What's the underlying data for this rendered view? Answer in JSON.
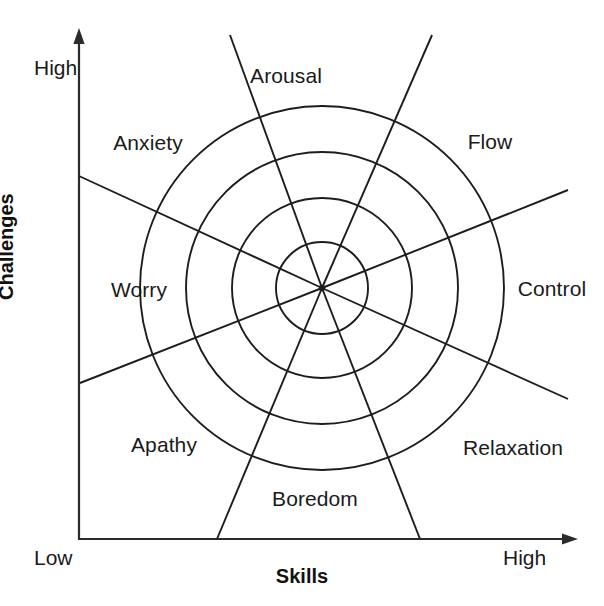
{
  "diagram": {
    "type": "flow-model-octant-chart",
    "axes": {
      "y_title": "Challenges",
      "x_title": "Skills",
      "y_low_label": "Low",
      "y_high_label": "High",
      "x_low_label": "Low",
      "x_high_label": "High"
    },
    "sectors": [
      {
        "id": "arousal",
        "label": "Arousal"
      },
      {
        "id": "flow",
        "label": "Flow"
      },
      {
        "id": "control",
        "label": "Control"
      },
      {
        "id": "relaxation",
        "label": "Relaxation"
      },
      {
        "id": "boredom",
        "label": "Boredom"
      },
      {
        "id": "apathy",
        "label": "Apathy"
      },
      {
        "id": "worry",
        "label": "Worry"
      },
      {
        "id": "anxiety",
        "label": "Anxiety"
      }
    ],
    "colors": {
      "ink": "#1a1a1a",
      "axis": "#2b2b2b",
      "background": "#ffffff"
    },
    "geometry": {
      "center_x": 322,
      "center_y": 288,
      "ring_radii": [
        46,
        90,
        136,
        182
      ],
      "spoke_angles_deg": [
        21.7,
        66.5,
        110.0,
        155.2,
        201.5,
        247.3,
        291.3,
        335.7
      ]
    }
  }
}
